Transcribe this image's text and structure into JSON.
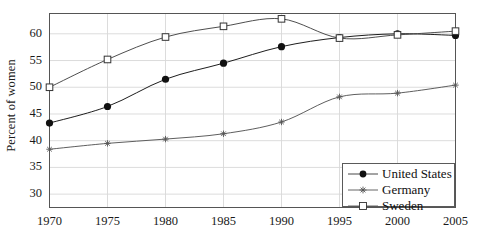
{
  "chart_data": {
    "type": "line",
    "title": "",
    "xlabel": "",
    "ylabel": "Percent of women",
    "x": [
      1970,
      1975,
      1980,
      1985,
      1990,
      1995,
      2000,
      2005
    ],
    "xtick_labels": [
      "1970",
      "1975",
      "1980",
      "1985",
      "1990",
      "1995",
      "2000",
      "2005"
    ],
    "ytick_labels": [
      "30",
      "35",
      "40",
      "45",
      "50",
      "55",
      "60"
    ],
    "yticks": [
      30,
      35,
      40,
      45,
      50,
      55,
      60
    ],
    "xlim": [
      1970,
      2005
    ],
    "ylim": [
      27.5,
      63.8
    ],
    "grid": true,
    "legend_position": "bottom-right",
    "series": [
      {
        "name": "United States",
        "marker": "filled-circle",
        "color": "#111111",
        "values": [
          43.3,
          46.4,
          51.5,
          54.5,
          57.6,
          59.3,
          60.0,
          59.7
        ]
      },
      {
        "name": "Germany",
        "marker": "star",
        "color": "#555555",
        "values": [
          38.4,
          39.5,
          40.3,
          41.3,
          43.5,
          48.2,
          48.9,
          50.4
        ]
      },
      {
        "name": "Sweden",
        "marker": "open-square",
        "color": "#444444",
        "values": [
          50.0,
          55.2,
          59.4,
          61.4,
          62.8,
          59.2,
          59.8,
          60.5
        ]
      }
    ]
  },
  "legend": {
    "entries": [
      {
        "label": "United States"
      },
      {
        "label": "Germany"
      },
      {
        "label": "Sweden"
      }
    ]
  },
  "colors": {
    "axis": "#555555",
    "grid": "#d8d8d8",
    "text": "#141414",
    "background": "#ffffff"
  }
}
